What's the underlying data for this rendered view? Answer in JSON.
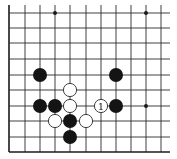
{
  "diagram": {
    "type": "go-board-fragment",
    "background": "#ffffff",
    "line_color": "#2a2a2a",
    "border_color": "#1a1a1a",
    "black_stone_color": "#141414",
    "white_stone_fill": "#ffffff",
    "white_stone_stroke": "#2a2a2a",
    "columns_x": [
      9,
      25,
      40,
      55,
      70,
      86,
      101,
      116,
      131,
      146,
      161
    ],
    "rows_y": [
      13,
      28,
      43,
      59,
      75,
      90,
      106,
      121,
      137,
      152
    ],
    "edges": {
      "left": true,
      "bottom": true,
      "top": false,
      "right": false
    },
    "line_extent": {
      "x_min": 9,
      "x_max": 170,
      "y_min": 5,
      "y_max": 152
    },
    "stone_radius": 7,
    "hoshi": [
      {
        "col": 3,
        "row": 0
      },
      {
        "col": 9,
        "row": 0
      },
      {
        "col": 9,
        "row": 6
      }
    ],
    "stones": [
      {
        "color": "black",
        "col": 2,
        "row": 4
      },
      {
        "color": "black",
        "col": 7,
        "row": 4
      },
      {
        "color": "white",
        "col": 4,
        "row": 5
      },
      {
        "color": "black",
        "col": 2,
        "row": 6
      },
      {
        "color": "black",
        "col": 3,
        "row": 6
      },
      {
        "color": "white",
        "col": 4,
        "row": 6
      },
      {
        "color": "white",
        "col": 6,
        "row": 6,
        "label": "1"
      },
      {
        "color": "black",
        "col": 7,
        "row": 6
      },
      {
        "color": "white",
        "col": 3,
        "row": 7
      },
      {
        "color": "black",
        "col": 4,
        "row": 7
      },
      {
        "color": "white",
        "col": 5,
        "row": 7
      },
      {
        "color": "black",
        "col": 4,
        "row": 8
      }
    ]
  },
  "caption": {
    "text": ""
  }
}
